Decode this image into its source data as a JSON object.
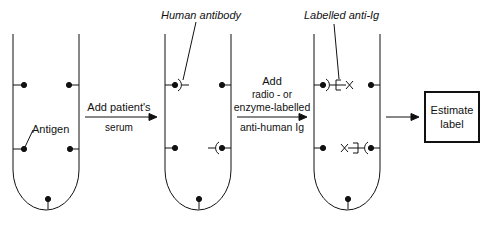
{
  "diagram": {
    "title": "",
    "tubes": [
      {
        "id": "tube-1",
        "step": "Antigen-coated tube"
      },
      {
        "id": "tube-2",
        "step": "Human antibody bound"
      },
      {
        "id": "tube-3",
        "step": "Labelled anti-Ig bound"
      }
    ],
    "labels": {
      "antigen": "Antigen",
      "human_antibody": "Human antibody",
      "labelled_anti_ig": "Labelled anti-Ig"
    },
    "arrows": [
      {
        "line1": "Add patient's",
        "line2": "serum"
      },
      {
        "line1": "Add",
        "line2": "radio - or",
        "line3": "enzyme-labelled",
        "line4": "anti-human Ig"
      },
      {
        "line1": ""
      }
    ],
    "output_box": {
      "line1": "Estimate",
      "line2": "label"
    },
    "colors": {
      "ink": "#111111",
      "background": "#ffffff"
    }
  }
}
